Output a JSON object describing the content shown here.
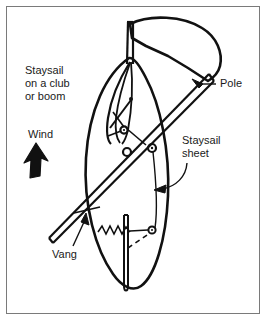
{
  "figure": {
    "type": "line-diagram",
    "background_color": "#ffffff",
    "ink_color": "#111111",
    "border_color": "#7a7a7a"
  },
  "labels": {
    "staysail_club": "Staysail\non a club\nor boom",
    "wind": "Wind",
    "pole": "Pole",
    "staysail_sheet": "Staysail\nsheet",
    "vang": "Vang"
  },
  "annotations": {
    "wind_arrow": "thick-arrow-up-left",
    "pole_leader": "arrow-left",
    "sheet_leader": "curved-arrow-down-left",
    "vang_leader": "arrow-up-right"
  },
  "parts": [
    "mast",
    "sail-panel",
    "staysail-luff",
    "club-boom",
    "pole",
    "pole-fitting-block",
    "sheet-block",
    "lower-ring",
    "shock-cord-spring",
    "vertical-spar",
    "staysail-sheet-line",
    "dashed-line"
  ]
}
